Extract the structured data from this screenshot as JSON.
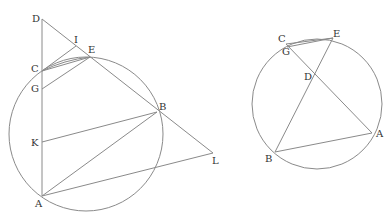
{
  "figures": [
    {
      "id": "left",
      "circle": {
        "cx": 86,
        "cy": 134,
        "r": 77
      },
      "points": {
        "D": [
          42,
          19
        ],
        "I": [
          76,
          46
        ],
        "E": [
          90,
          57
        ],
        "C": [
          42,
          71
        ],
        "G": [
          42,
          89
        ],
        "K": [
          42,
          142
        ],
        "B": [
          157,
          112
        ],
        "L": [
          213,
          153
        ],
        "A": [
          42,
          196
        ]
      },
      "labels": [
        {
          "text": "D",
          "x": 32,
          "y": 22
        },
        {
          "text": "I",
          "x": 74,
          "y": 43
        },
        {
          "text": "E",
          "x": 88,
          "y": 53
        },
        {
          "text": "C",
          "x": 31,
          "y": 72
        },
        {
          "text": "G",
          "x": 31,
          "y": 92
        },
        {
          "text": "B",
          "x": 159,
          "y": 110
        },
        {
          "text": "K",
          "x": 31,
          "y": 146
        },
        {
          "text": "L",
          "x": 212,
          "y": 164
        },
        {
          "text": "A",
          "x": 35,
          "y": 207
        }
      ],
      "segments": [
        [
          "D",
          "A"
        ],
        [
          "D",
          "L"
        ],
        [
          "C",
          "I"
        ],
        [
          "C",
          "E"
        ],
        [
          "G",
          "E"
        ],
        [
          "K",
          "B"
        ],
        [
          "A",
          "B"
        ],
        [
          "A",
          "L"
        ]
      ],
      "arcs": [
        "C-E chord arc"
      ]
    },
    {
      "id": "right",
      "circle": {
        "cx": 317,
        "cy": 107,
        "r": 65
      },
      "points": {
        "C": [
          286,
          44
        ],
        "G": [
          287,
          47
        ],
        "E": [
          333,
          38
        ],
        "D": [
          314,
          73
        ],
        "A": [
          372,
          133
        ],
        "B": [
          275,
          152
        ]
      },
      "labels": [
        {
          "text": "C",
          "x": 278,
          "y": 42
        },
        {
          "text": "G",
          "x": 282,
          "y": 54
        },
        {
          "text": "E",
          "x": 333,
          "y": 37
        },
        {
          "text": "D",
          "x": 304,
          "y": 80
        },
        {
          "text": "A",
          "x": 376,
          "y": 137
        },
        {
          "text": "B",
          "x": 265,
          "y": 162
        }
      ],
      "segments": [
        [
          "E",
          "B"
        ],
        [
          "C",
          "A"
        ],
        [
          "A",
          "B"
        ],
        [
          "C",
          "E"
        ],
        [
          "G",
          "E"
        ]
      ]
    }
  ]
}
